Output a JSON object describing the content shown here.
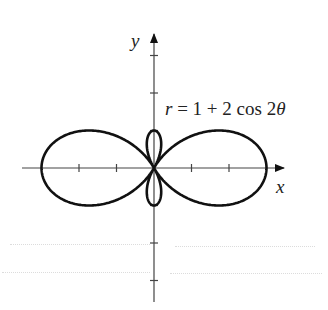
{
  "figure": {
    "equation_label": "r = 1 + 2 cos 2θ",
    "equation_parts": {
      "r": "r",
      "eq": " = 1 + 2 cos 2",
      "theta": "θ"
    },
    "x_axis_label": "x",
    "y_axis_label": "y",
    "curve": {
      "type": "polar",
      "equation": "r = 1 + 2cos(2θ)",
      "a": 1,
      "b": 2,
      "k": 2
    },
    "origin_px": [
      154,
      168
    ],
    "unit_px": 37.5,
    "x_ticks": [
      -2,
      -1,
      1,
      2
    ],
    "y_ticks": [
      -3,
      -2,
      -1,
      1,
      2,
      3
    ],
    "stroke_color": "#111111",
    "axis_color": "#444444"
  }
}
